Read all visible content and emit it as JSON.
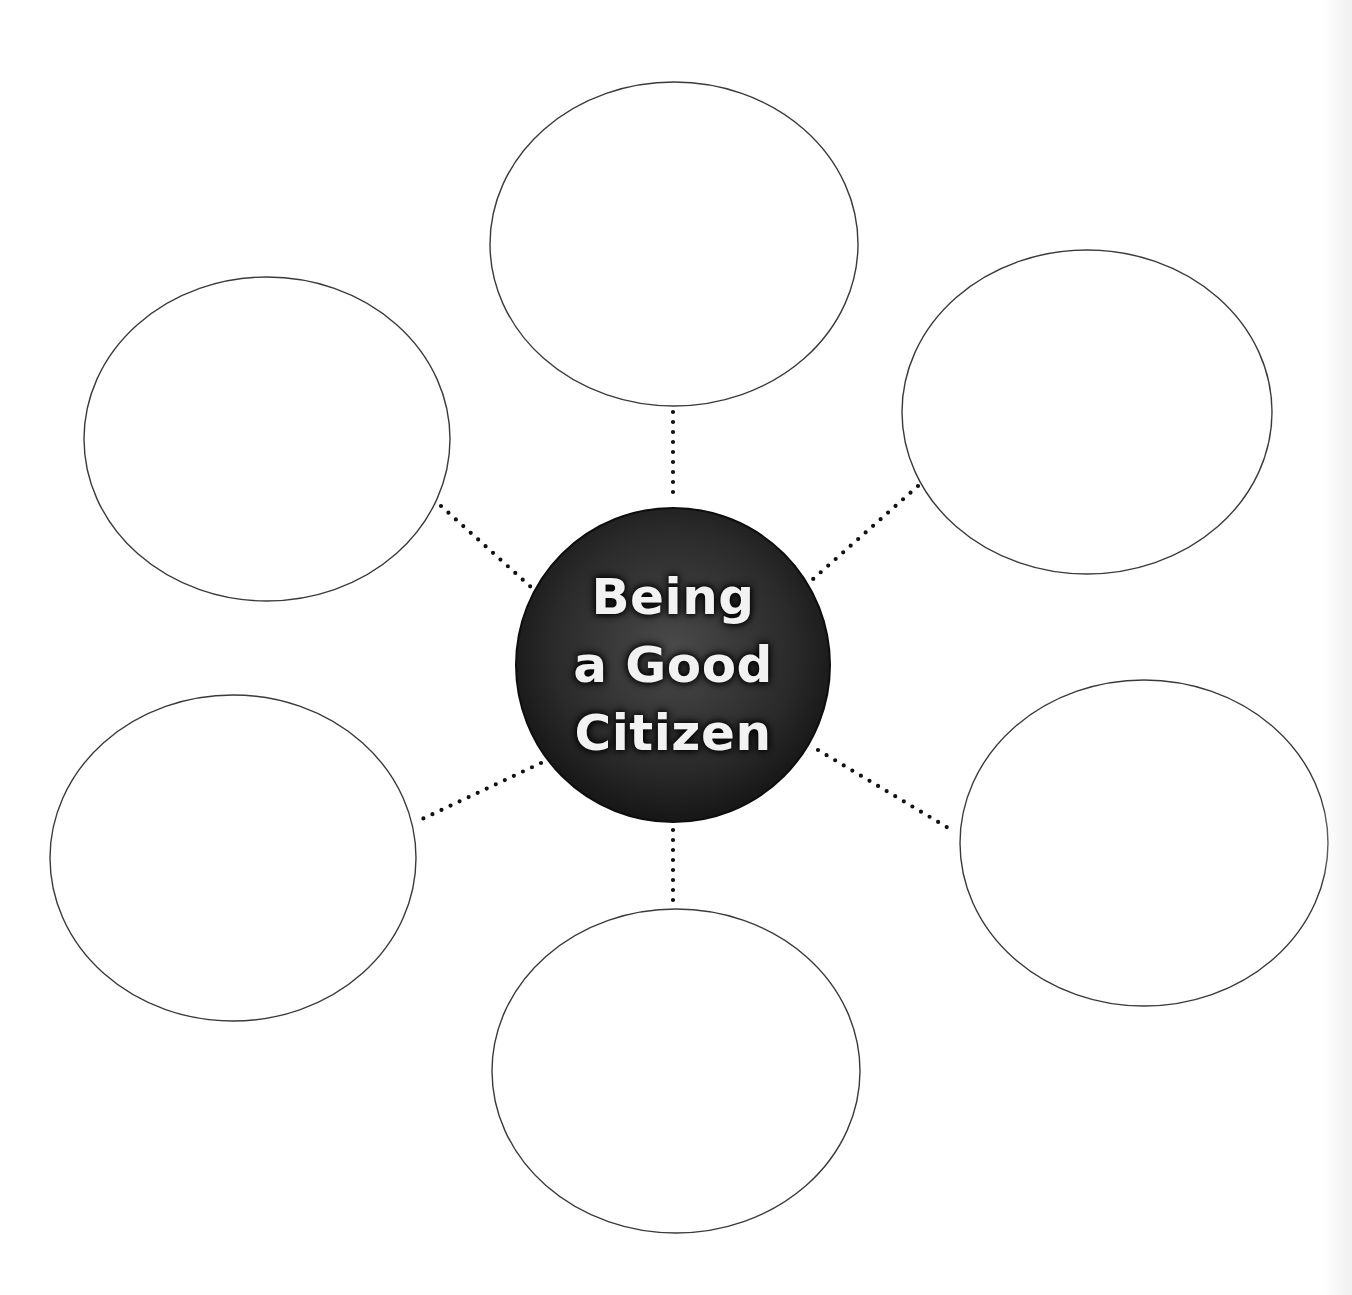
{
  "diagram": {
    "type": "bubble-map",
    "center": {
      "lines": [
        "Being",
        "a Good",
        "Citizen"
      ],
      "fill_dark": "#161616",
      "fill_light": "#4a4a4a",
      "text_color": "#f2f2f2"
    },
    "bubbles": [
      {
        "id": "top",
        "label": ""
      },
      {
        "id": "upper-right",
        "label": ""
      },
      {
        "id": "lower-right",
        "label": ""
      },
      {
        "id": "bottom",
        "label": ""
      },
      {
        "id": "lower-left",
        "label": ""
      },
      {
        "id": "upper-left",
        "label": ""
      }
    ],
    "colors": {
      "bubble_stroke": "#3a3a3a",
      "connector": "#111111",
      "background": "#ffffff"
    }
  }
}
